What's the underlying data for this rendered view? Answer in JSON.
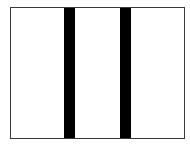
{
  "figure": {
    "type": "three-column-layout-icon",
    "frame": {
      "border_color": "#3a3a3a",
      "fill_color": "#ffffff"
    },
    "columns": 3,
    "dividers": [
      {
        "name": "divider-1",
        "color": "#000000"
      },
      {
        "name": "divider-2",
        "color": "#000000"
      }
    ]
  }
}
